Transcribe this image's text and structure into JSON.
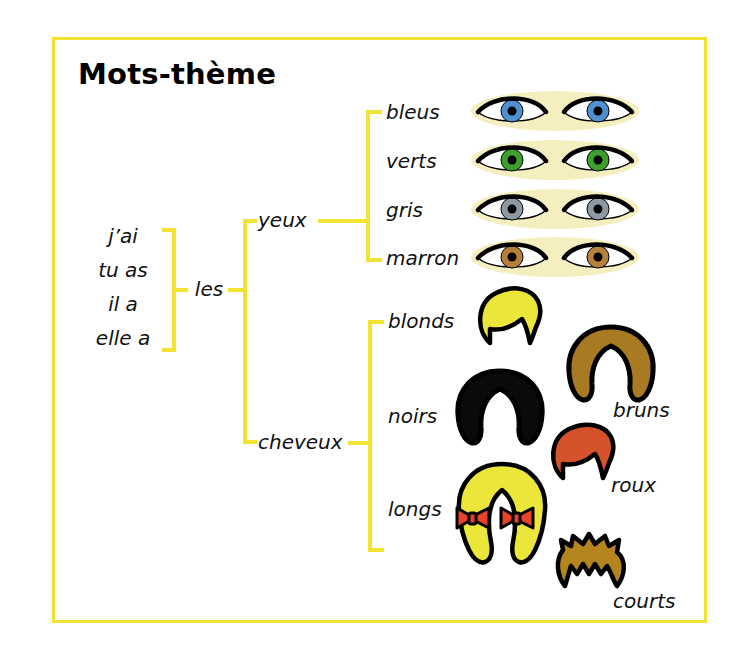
{
  "page": {
    "title": "Mots-thème",
    "border_color": "#f2e231",
    "background": "#ffffff"
  },
  "tree": {
    "subjects": [
      {
        "label": "j’ai"
      },
      {
        "label": "tu as"
      },
      {
        "label": "il a"
      },
      {
        "label": "elle a"
      }
    ],
    "determiner": {
      "label": "les"
    },
    "branches": [
      {
        "label": "yeux",
        "children": [
          {
            "label": "bleus",
            "color": "#4f90d0",
            "illustration": "eyes-blue"
          },
          {
            "label": "verts",
            "color": "#3ca02c",
            "illustration": "eyes-green"
          },
          {
            "label": "gris",
            "color": "#8d9aa4",
            "illustration": "eyes-grey"
          },
          {
            "label": "marron",
            "color": "#b5803a",
            "illustration": "eyes-brown"
          }
        ]
      },
      {
        "label": "cheveux",
        "children": [
          {
            "label": "blonds",
            "color": "#ece63a",
            "illustration": "hair-blond-short"
          },
          {
            "label": "noirs",
            "color": "#0a0a0a",
            "illustration": "hair-black-bob"
          },
          {
            "label": "longs",
            "color": "#ece63a",
            "illustration": "hair-blond-pigtails"
          }
        ],
        "extra_children": [
          {
            "label": "bruns",
            "color": "#a87b22",
            "illustration": "hair-brown-bob"
          },
          {
            "label": "roux",
            "color": "#d6522b",
            "illustration": "hair-red-short"
          },
          {
            "label": "courts",
            "color": "#b4841f",
            "illustration": "hair-brown-spiky"
          }
        ]
      }
    ]
  },
  "illustration_details": {
    "skin_tone": "#f5efc0",
    "eye_white": "#ffffff",
    "pupil": "#000000",
    "outline": "#000000",
    "bow_color": "#e8432a",
    "bow_count": 2
  }
}
